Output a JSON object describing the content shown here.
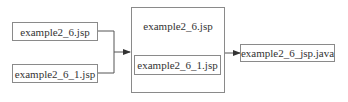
{
  "diagram": {
    "inputs": [
      {
        "label": "example2_6.jsp"
      },
      {
        "label": "example2_6_1.jsp"
      }
    ],
    "container": {
      "title": "example2_6.jsp",
      "inner_label": "example2_6_1.jsp"
    },
    "output": {
      "label": "example2_6_jsp.java"
    }
  }
}
